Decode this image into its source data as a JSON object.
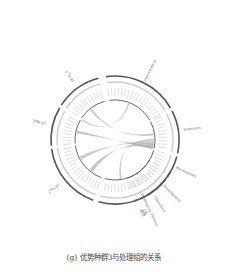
{
  "caption": "(g) 优势种群3与处理组的关系",
  "diagram": {
    "type": "circos-chord",
    "center": [
      115,
      140
    ],
    "groups_left": [
      {
        "id": "g1",
        "label": "27‰ g1",
        "start": 200,
        "end": 262
      },
      {
        "id": "g3",
        "label": "29‰ g3",
        "start": 265,
        "end": 300
      },
      {
        "id": "g2",
        "label": "27‰ g2",
        "start": 303,
        "end": 345
      },
      {
        "id": "ck",
        "label": "CK",
        "start": 120,
        "end": 195
      }
    ],
    "groups_right": [
      {
        "id": "act",
        "label": "Actinobacteria",
        "start": 352,
        "end": 60
      },
      {
        "id": "fir",
        "label": "Firmicutes",
        "start": 63,
        "end": 102
      },
      {
        "id": "bac",
        "label": "Bacteroidetes",
        "start": 105,
        "end": 125
      },
      {
        "id": "pro",
        "label": "Proteobacteria",
        "start": 128,
        "end": 140
      },
      {
        "id": "chl",
        "label": "Chloroflexi",
        "start": 142,
        "end": 150
      },
      {
        "id": "dei",
        "label": "Deinococcus-Thermus",
        "start": 152,
        "end": 157
      },
      {
        "id": "oth",
        "label": "其他",
        "start": 158,
        "end": 162
      }
    ],
    "colors": {
      "ring_dark": "#555555",
      "ring_light": "#cccccc",
      "chord": "#9a9a9a",
      "tick_text": "#888888",
      "label_text": "#666666"
    }
  }
}
